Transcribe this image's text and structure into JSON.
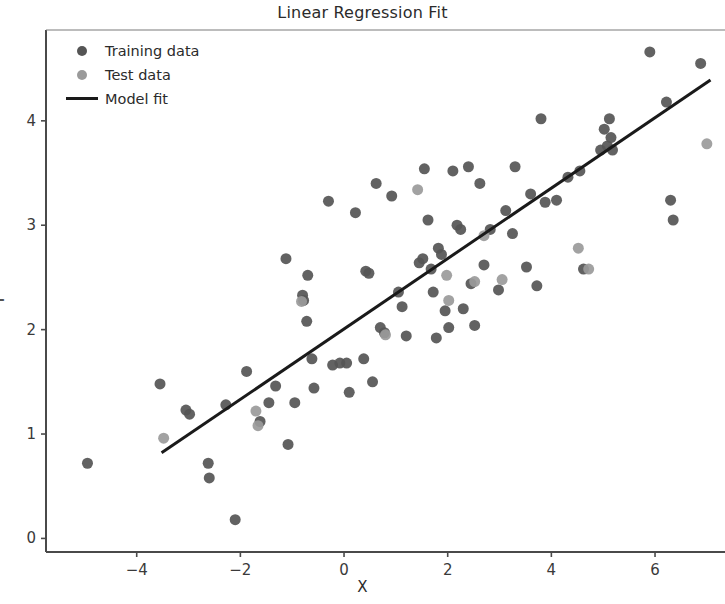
{
  "chart_data": {
    "type": "scatter",
    "title": "Linear Regression Fit",
    "xlabel": "X",
    "ylabel": "Y",
    "xlim": [
      -5.75,
      7.35
    ],
    "ylim": [
      -0.13,
      4.87
    ],
    "xticks": [
      -4,
      -2,
      0,
      2,
      4,
      6
    ],
    "yticks": [
      0,
      1,
      2,
      3,
      4
    ],
    "xtick_labels": [
      "−4",
      "−2",
      "0",
      "2",
      "4",
      "6"
    ],
    "ytick_labels": [
      "0",
      "1",
      "2",
      "3",
      "4"
    ],
    "grid": false,
    "legend_position": "upper left",
    "legend": [
      {
        "label": "Training data",
        "marker": "circle",
        "color": "#555555"
      },
      {
        "label": "Test data",
        "marker": "circle",
        "color": "#9a9a9a"
      },
      {
        "label": "Model fit",
        "marker": "line",
        "color": "#1a1a1a"
      }
    ],
    "series": [
      {
        "name": "Training data",
        "marker": "circle",
        "color": "#555555",
        "size": 11,
        "points": [
          [
            -4.95,
            0.72
          ],
          [
            -3.55,
            1.48
          ],
          [
            -3.05,
            1.23
          ],
          [
            -2.98,
            1.19
          ],
          [
            -2.62,
            0.72
          ],
          [
            -2.6,
            0.58
          ],
          [
            -2.28,
            1.28
          ],
          [
            -2.1,
            0.18
          ],
          [
            -1.88,
            1.6
          ],
          [
            -1.62,
            1.12
          ],
          [
            -1.45,
            1.3
          ],
          [
            -1.32,
            1.46
          ],
          [
            -1.12,
            2.68
          ],
          [
            -1.08,
            0.9
          ],
          [
            -0.95,
            1.3
          ],
          [
            -0.8,
            2.33
          ],
          [
            -0.78,
            2.28
          ],
          [
            -0.72,
            2.08
          ],
          [
            -0.7,
            2.52
          ],
          [
            -0.62,
            1.72
          ],
          [
            -0.58,
            1.44
          ],
          [
            -0.3,
            3.23
          ],
          [
            -0.22,
            1.66
          ],
          [
            -0.08,
            1.68
          ],
          [
            0.05,
            1.68
          ],
          [
            0.1,
            1.4
          ],
          [
            0.22,
            3.12
          ],
          [
            0.38,
            1.72
          ],
          [
            0.42,
            2.56
          ],
          [
            0.48,
            2.54
          ],
          [
            0.55,
            1.5
          ],
          [
            0.62,
            3.4
          ],
          [
            0.7,
            2.02
          ],
          [
            0.78,
            1.97
          ],
          [
            0.92,
            3.28
          ],
          [
            1.05,
            2.36
          ],
          [
            1.12,
            2.22
          ],
          [
            1.2,
            1.94
          ],
          [
            1.45,
            2.64
          ],
          [
            1.52,
            2.68
          ],
          [
            1.55,
            3.54
          ],
          [
            1.62,
            3.05
          ],
          [
            1.68,
            2.58
          ],
          [
            1.72,
            2.36
          ],
          [
            1.78,
            1.92
          ],
          [
            1.82,
            2.78
          ],
          [
            1.88,
            2.72
          ],
          [
            1.95,
            2.18
          ],
          [
            2.02,
            2.02
          ],
          [
            2.1,
            3.52
          ],
          [
            2.18,
            3.0
          ],
          [
            2.25,
            2.96
          ],
          [
            2.3,
            2.2
          ],
          [
            2.4,
            3.56
          ],
          [
            2.45,
            2.44
          ],
          [
            2.52,
            2.04
          ],
          [
            2.62,
            3.4
          ],
          [
            2.7,
            2.62
          ],
          [
            2.82,
            2.96
          ],
          [
            2.98,
            2.38
          ],
          [
            3.12,
            3.14
          ],
          [
            3.25,
            2.92
          ],
          [
            3.3,
            3.56
          ],
          [
            3.52,
            2.6
          ],
          [
            3.6,
            3.3
          ],
          [
            3.72,
            2.42
          ],
          [
            3.8,
            4.02
          ],
          [
            3.88,
            3.22
          ],
          [
            4.1,
            3.24
          ],
          [
            4.32,
            3.46
          ],
          [
            4.55,
            3.52
          ],
          [
            4.62,
            2.58
          ],
          [
            4.95,
            3.72
          ],
          [
            5.02,
            3.92
          ],
          [
            5.08,
            3.76
          ],
          [
            5.12,
            4.02
          ],
          [
            5.15,
            3.84
          ],
          [
            5.18,
            3.72
          ],
          [
            5.9,
            4.66
          ],
          [
            6.22,
            4.18
          ],
          [
            6.3,
            3.24
          ],
          [
            6.35,
            3.05
          ],
          [
            6.88,
            4.55
          ]
        ]
      },
      {
        "name": "Test data",
        "marker": "circle",
        "color": "#9a9a9a",
        "size": 11,
        "points": [
          [
            -3.48,
            0.96
          ],
          [
            -1.7,
            1.22
          ],
          [
            -1.66,
            1.08
          ],
          [
            -0.82,
            2.27
          ],
          [
            0.8,
            1.95
          ],
          [
            1.42,
            3.34
          ],
          [
            1.98,
            2.52
          ],
          [
            2.02,
            2.28
          ],
          [
            2.52,
            2.46
          ],
          [
            2.7,
            2.9
          ],
          [
            3.05,
            2.48
          ],
          [
            4.52,
            2.78
          ],
          [
            4.72,
            2.58
          ],
          [
            7.0,
            3.78
          ]
        ]
      }
    ],
    "fit_line": {
      "name": "Model fit",
      "color": "#1a1a1a",
      "width": 3,
      "slope": 0.337,
      "intercept": 2.01,
      "x_start": -3.52,
      "x_end": 7.07,
      "y_start": 0.82,
      "y_end": 4.39
    }
  }
}
